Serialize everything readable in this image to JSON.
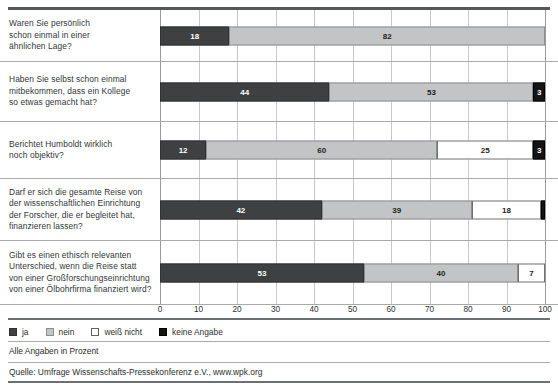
{
  "chart_data": {
    "type": "bar",
    "orientation": "horizontal",
    "stacked": true,
    "title": "",
    "xlabel": "",
    "ylabel": "",
    "xlim": [
      0,
      100
    ],
    "xticks": [
      0,
      10,
      20,
      30,
      40,
      50,
      60,
      70,
      80,
      90,
      100
    ],
    "grid": "vertical",
    "legend_position": "bottom-left",
    "categories": [
      "Waren Sie persönlich schon einmal in einer ähnlichen Lage?",
      "Haben Sie selbst schon einmal mitbekommen, dass ein Kollege so etwas gemacht hat?",
      "Berichtet Humboldt wirklich noch objektiv?",
      "Darf er sich die gesamte Reise von der wissenschaftlichen Einrichtung der Forscher, die er begleitet hat, finanzieren lassen?",
      "Gibt es einen ethisch relevanten Unterschied, wenn die Reise statt von einer Großforschungseinrichtung von einer Ölbohrfirma finanziert wird?"
    ],
    "series": [
      {
        "name": "ja",
        "color": "#3f4042",
        "values": [
          18,
          44,
          12,
          42,
          53
        ]
      },
      {
        "name": "nein",
        "color": "#c3c4c5",
        "values": [
          82,
          53,
          60,
          39,
          40
        ]
      },
      {
        "name": "weiß nicht",
        "color": "#ffffff",
        "values": [
          0,
          0,
          25,
          18,
          7
        ]
      },
      {
        "name": "keine Angabe",
        "color": "#141414",
        "values": [
          0,
          3,
          3,
          1,
          0
        ]
      }
    ],
    "annotations": [
      "Alle Angaben in Prozent",
      "Quelle: Umfrage Wissenschafts-Pressekonferenz e.V., www.wpk.org"
    ]
  },
  "rows": [
    {
      "label_lines": [
        "Waren Sie persönlich",
        "schon einmal in einer",
        "ähnlichen Lage?"
      ],
      "segments": [
        {
          "series": "ja",
          "value": 18,
          "label": "18"
        },
        {
          "series": "nein",
          "value": 82,
          "label": "82"
        }
      ]
    },
    {
      "label_lines": [
        "Haben Sie selbst schon einmal",
        "mitbekommen, dass ein Kollege",
        "so etwas gemacht hat?"
      ],
      "segments": [
        {
          "series": "ja",
          "value": 44,
          "label": "44"
        },
        {
          "series": "nein",
          "value": 53,
          "label": "53"
        },
        {
          "series": "keine Angabe",
          "value": 3,
          "label": "3"
        }
      ]
    },
    {
      "label_lines": [
        "Berichtet Humboldt wirklich",
        "noch objektiv?"
      ],
      "segments": [
        {
          "series": "ja",
          "value": 12,
          "label": "12"
        },
        {
          "series": "nein",
          "value": 60,
          "label": "60"
        },
        {
          "series": "weiß nicht",
          "value": 25,
          "label": "25"
        },
        {
          "series": "keine Angabe",
          "value": 3,
          "label": "3"
        }
      ]
    },
    {
      "label_lines": [
        "Darf er sich die gesamte Reise von",
        "der wissenschaftlichen Einrichtung",
        "der Forscher, die er begleitet hat,",
        "finanzieren lassen?"
      ],
      "segments": [
        {
          "series": "ja",
          "value": 42,
          "label": "42"
        },
        {
          "series": "nein",
          "value": 39,
          "label": "39"
        },
        {
          "series": "weiß nicht",
          "value": 18,
          "label": "18"
        },
        {
          "series": "keine Angabe",
          "value": 1,
          "label": ""
        }
      ]
    },
    {
      "label_lines": [
        "Gibt es einen ethisch relevanten",
        "Unterschied, wenn die Reise statt",
        "von einer Großforschungseinrichtung",
        "von einer Ölbohrfirma finanziert wird?"
      ],
      "segments": [
        {
          "series": "ja",
          "value": 53,
          "label": "53"
        },
        {
          "series": "nein",
          "value": 40,
          "label": "40"
        },
        {
          "series": "weiß nicht",
          "value": 7,
          "label": "7"
        }
      ]
    }
  ],
  "axis": {
    "ticks": [
      "0",
      "10",
      "20",
      "30",
      "40",
      "50",
      "60",
      "70",
      "80",
      "90",
      "100"
    ]
  },
  "legend": {
    "items": [
      {
        "key": "ja",
        "label": "ja"
      },
      {
        "key": "nein",
        "label": "nein"
      },
      {
        "key": "weiss",
        "label": "weiß nicht"
      },
      {
        "key": "keine",
        "label": "keine Angabe"
      }
    ]
  },
  "footer": {
    "unit_note": "Alle Angaben in Prozent",
    "source": "Quelle: Umfrage Wissenschafts-Pressekonferenz e.V., www.wpk.org"
  }
}
